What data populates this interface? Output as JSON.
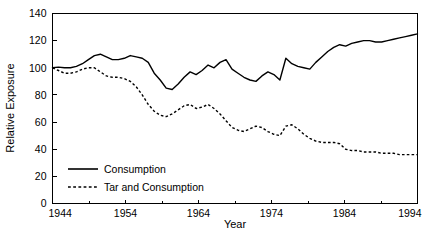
{
  "chart_data": {
    "type": "line",
    "title": "",
    "xlabel": "Year",
    "ylabel": "Relative Exposure",
    "xlim": [
      1944,
      1994
    ],
    "ylim": [
      0,
      140
    ],
    "xticks": [
      1944,
      1954,
      1964,
      1974,
      1984,
      1994
    ],
    "yticks": [
      0,
      20,
      40,
      60,
      80,
      100,
      120,
      140
    ],
    "xticklabels": [
      "1944",
      "1954",
      "1964",
      "1974",
      "1984",
      "1994"
    ],
    "yticklabels": [
      "0",
      "20",
      "40",
      "60",
      "80",
      "100",
      "120",
      "140"
    ],
    "xminorticks": [
      1949,
      1959,
      1969,
      1979,
      1989
    ],
    "grid": false,
    "legend_position": "lower-left-inside",
    "x": [
      1944,
      1945,
      1946,
      1947,
      1948,
      1949,
      1950,
      1951,
      1952,
      1953,
      1954,
      1955,
      1956,
      1957,
      1958,
      1959,
      1960,
      1961,
      1962,
      1963,
      1964,
      1965,
      1966,
      1967,
      1968,
      1969,
      1970,
      1971,
      1972,
      1973,
      1974,
      1975,
      1976,
      1977,
      1978,
      1979,
      1980,
      1981,
      1982,
      1983,
      1984,
      1985,
      1986,
      1987,
      1988,
      1989,
      1990,
      1991,
      1992,
      1993,
      1994
    ],
    "series": [
      {
        "name": "Consumption",
        "style": "solid",
        "color": "#000000",
        "values": [
          100,
          100.5,
          100,
          100,
          101,
          103,
          106,
          109,
          110,
          108,
          106,
          106,
          107,
          109,
          108,
          107,
          104,
          96,
          91,
          85,
          84,
          88,
          93,
          97,
          95,
          98,
          102,
          100,
          104,
          106,
          99,
          96,
          93,
          91,
          90,
          94,
          97,
          95,
          91,
          107,
          103,
          101,
          100,
          99,
          104,
          108,
          112,
          115,
          117,
          116,
          118
        ]
      },
      {
        "name": "Tar and Consumption",
        "style": "dashed",
        "color": "#000000",
        "values": [
          100,
          98,
          96,
          96,
          97,
          99,
          100,
          100,
          97,
          94,
          93,
          93,
          92,
          90,
          86,
          80,
          73,
          68,
          65,
          64,
          66,
          69,
          72,
          73,
          70,
          71,
          73,
          70,
          66,
          61,
          56,
          54,
          53,
          55,
          57,
          56,
          53,
          51,
          50,
          57,
          58,
          55,
          51,
          48,
          46,
          45,
          45,
          45,
          44,
          40,
          39
        ]
      }
    ],
    "series_tail": {
      "Consumption": [
        119,
        120,
        120,
        119,
        119,
        120,
        121,
        122,
        123,
        124,
        125
      ],
      "Tar and Consumption": [
        39,
        38,
        38,
        38,
        37,
        37,
        37,
        36,
        36,
        36,
        36
      ]
    }
  },
  "legend": {
    "entries": [
      {
        "label": "Consumption",
        "style": "solid"
      },
      {
        "label": "Tar and Consumption",
        "style": "dashed"
      }
    ]
  },
  "axes": {
    "x_title": "Year",
    "y_title": "Relative Exposure"
  }
}
